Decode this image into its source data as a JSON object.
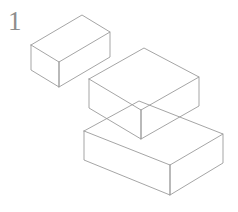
{
  "figure": {
    "label": "1",
    "label_color": "#8e8e8e",
    "background_color": "#ffffff",
    "line_color": "#9b9b9b",
    "line_width": 0.9,
    "projection": "isometric",
    "style": "wireframe-transparent",
    "partial_caption": "",
    "shapes": [
      {
        "name": "upper-left-box",
        "description": "isometric rectangular box, upper left, separate from the other two",
        "vertices": {
          "top_left": [
            31,
            45
          ],
          "top_front": [
            59,
            62
          ],
          "top_right": [
            110,
            32
          ],
          "top_back": [
            82,
            15
          ],
          "bottom_left": [
            31,
            70
          ],
          "bottom_front": [
            59,
            87
          ],
          "bottom_right": [
            110,
            57
          ]
        }
      },
      {
        "name": "middle-box",
        "description": "isometric rectangular box, center, overlapping the lower box",
        "vertices": {
          "top_left": [
            89,
            79
          ],
          "top_front": [
            141,
            110
          ],
          "top_right": [
            199,
            77
          ],
          "top_back": [
            144,
            48
          ],
          "bottom_left": [
            89,
            108
          ],
          "bottom_front": [
            141,
            139
          ],
          "bottom_right": [
            199,
            106
          ]
        }
      },
      {
        "name": "lower-right-box",
        "description": "isometric rectangular box, lower right, overlapping the middle box",
        "vertices": {
          "top_left": [
            84,
            131
          ],
          "top_front": [
            170,
            165
          ],
          "top_right": [
            223,
            134
          ],
          "top_back": [
            139,
            101
          ],
          "bottom_left": [
            84,
            160
          ],
          "bottom_front": [
            170,
            195
          ],
          "bottom_right": [
            223,
            163
          ]
        }
      }
    ]
  }
}
